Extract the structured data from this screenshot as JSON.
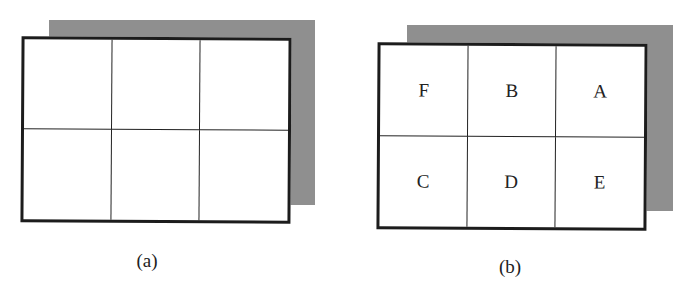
{
  "figure": {
    "panels": [
      {
        "id": "a",
        "caption": "(a)",
        "grid": {
          "rows": 2,
          "cols": 3
        },
        "cells": [
          "",
          "",
          "",
          "",
          "",
          ""
        ]
      },
      {
        "id": "b",
        "caption": "(b)",
        "grid": {
          "rows": 2,
          "cols": 3
        },
        "cells": [
          "F",
          "B",
          "A",
          "C",
          "D",
          "E"
        ]
      }
    ],
    "colors": {
      "frame": "#1c1c1c",
      "shadow": "#bdbdbd",
      "background": "#ffffff"
    }
  }
}
